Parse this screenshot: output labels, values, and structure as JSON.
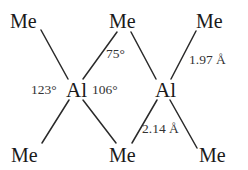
{
  "diagram": {
    "title": "",
    "atoms": {
      "me_top_left": "Me",
      "me_top_center": "Me",
      "me_top_right": "Me",
      "al_left": "Al",
      "al_right": "Al",
      "me_bottom_left": "Me",
      "me_bottom_center": "Me",
      "me_bottom_right": "Me"
    },
    "labels": {
      "bridge_angle": "75°",
      "terminal_angle": "123°",
      "bridge_terminal_angle": "106°",
      "terminal_bond_length": "1.97 Å",
      "bridge_bond_length": "2.14 Å"
    },
    "colors": {
      "line": "#2a2a2a",
      "text": "#1a1a1a",
      "background": "#ffffff"
    }
  }
}
